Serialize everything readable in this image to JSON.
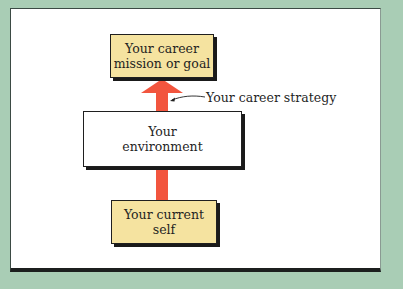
{
  "diagram": {
    "boxes": {
      "goal": {
        "text": "Your career\nmission or goal",
        "fill": "#f5e3a0"
      },
      "environment": {
        "text": "Your\nenvironment",
        "fill": "#ffffff"
      },
      "current_self": {
        "text": "Your current\nself",
        "fill": "#f5e3a0"
      }
    },
    "arrow": {
      "color": "#f2553e",
      "direction": "up"
    },
    "annotation": {
      "text": "Your career strategy"
    },
    "colors": {
      "background": "#a9cdb5",
      "panel": "#ffffff",
      "shadow": "#1a1a1a"
    }
  }
}
